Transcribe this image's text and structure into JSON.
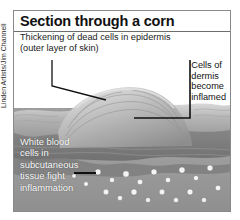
{
  "figure": {
    "title": "Section through a corn",
    "credit": "Linden Artists/Jim Channell",
    "labels": {
      "epidermis": "Thickening of dead cells in epidermis\n(outer layer of skin)",
      "dermis": "Cells of\ndermis\nbecome\ninflamed",
      "white_blood_cells": "White blood\ncells in\nsubcutaneous\ntissue fight\ninflammation"
    },
    "colors": {
      "frame_border": "#8a8a8a",
      "title_rule": "#6d6d6d",
      "title_text": "#111111",
      "label_text": "#1a1a1a",
      "overlay_label_text": "#ffffff",
      "leader_line": "#111111",
      "skin_surface": "#b9b9b9",
      "epidermis_mid": "#a8a8a8",
      "dermis": "#8e8e8e",
      "subcutaneous": "#9a9a9a",
      "cell_fill": "#f2f2f2"
    }
  }
}
